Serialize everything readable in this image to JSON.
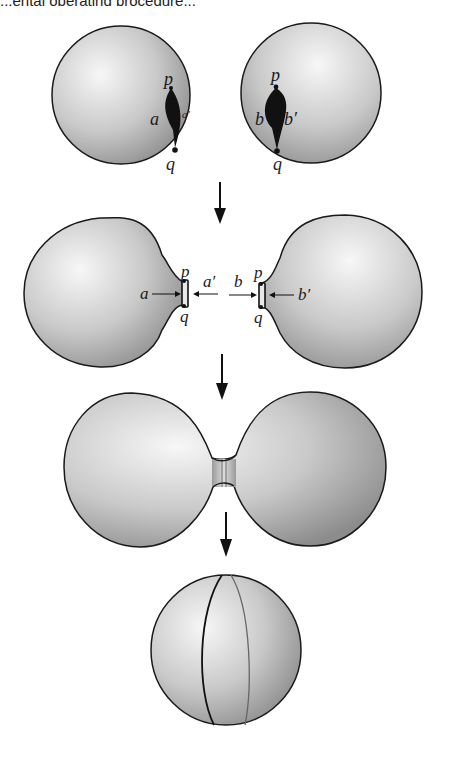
{
  "header": {
    "cropped_text": "...ental operating procedure..."
  },
  "diagram": {
    "stages": [
      {
        "id": "stage-1",
        "description": "Two spheres, each with a slit cut from p to q",
        "left_sphere": {
          "labels": {
            "top": "p",
            "bottom": "q",
            "left": "a",
            "right": "a′"
          }
        },
        "right_sphere": {
          "labels": {
            "top": "p",
            "bottom": "q",
            "left": "b",
            "right": "b′"
          }
        }
      },
      {
        "id": "stage-2",
        "description": "Slits opened into boundary tubes facing each other",
        "left_sphere": {
          "labels": {
            "top": "p",
            "bottom": "q",
            "arrow_in": "a",
            "arrow_out": "a′"
          }
        },
        "right_sphere": {
          "labels": {
            "top": "p",
            "bottom": "q",
            "arrow_in": "b",
            "arrow_out": "b′"
          }
        }
      },
      {
        "id": "stage-3",
        "description": "Spheres joined along the tube (neck)"
      },
      {
        "id": "stage-4",
        "description": "Result is a single sphere with seam curve"
      }
    ],
    "arrows": [
      "down",
      "down",
      "down"
    ]
  },
  "colors": {
    "outline": "#1a1a1a",
    "shade_light": "#f4f4f4",
    "shade_dark": "#8a8a8a"
  }
}
